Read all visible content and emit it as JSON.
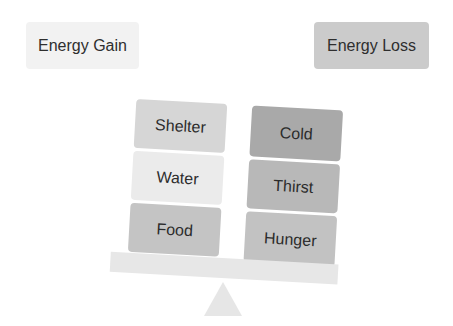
{
  "headers": {
    "gain": {
      "label": "Energy Gain",
      "color": "#f2f2f2"
    },
    "loss": {
      "label": "Energy Loss",
      "color": "#cbcbcb"
    }
  },
  "scale": {
    "tilt_degrees": 3.2,
    "left_pan": [
      {
        "label": "Shelter",
        "color": "#d6d6d6"
      },
      {
        "label": "Water",
        "color": "#ebebeb"
      },
      {
        "label": "Food",
        "color": "#c4c4c4"
      }
    ],
    "right_pan": [
      {
        "label": "Cold",
        "color": "#a9a9a9"
      },
      {
        "label": "Thirst",
        "color": "#b8b8b8"
      },
      {
        "label": "Hunger",
        "color": "#c2c2c2"
      }
    ],
    "beam_color": "#e7e7e7",
    "fulcrum_color": "#e6e6e6"
  }
}
